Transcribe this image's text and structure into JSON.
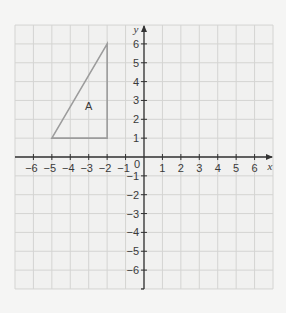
{
  "diagram": {
    "type": "coordinate-grid",
    "grid": {
      "x_min": -7,
      "x_max": 7,
      "y_min": -7,
      "y_max": 7,
      "color": "#d4d4d2",
      "background": "#f1f1f0"
    },
    "axes": {
      "x_label": "x",
      "y_label": "y",
      "origin_label": "0",
      "color": "#333333",
      "x_ticks": [
        -6,
        -5,
        -4,
        -3,
        -2,
        -1,
        1,
        2,
        3,
        4,
        5,
        6
      ],
      "y_ticks": [
        -6,
        -5,
        -4,
        -3,
        -2,
        -1,
        1,
        2,
        3,
        4,
        5,
        6
      ]
    },
    "shapes": [
      {
        "name": "A",
        "label": "A",
        "type": "triangle",
        "vertices": [
          [
            -5,
            1
          ],
          [
            -2,
            1
          ],
          [
            -2,
            6
          ]
        ],
        "label_position": [
          -3,
          2.7
        ],
        "stroke": "#9c9c9c"
      }
    ]
  }
}
